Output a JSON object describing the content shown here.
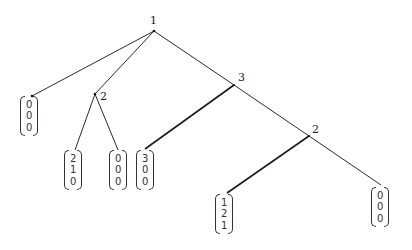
{
  "diagram": {
    "type": "tree",
    "nodes": [
      {
        "id": "root",
        "label": "1",
        "x": 154,
        "y": 31
      },
      {
        "id": "n2",
        "label": "2",
        "x": 95,
        "y": 94
      },
      {
        "id": "n3",
        "label": "3",
        "x": 234,
        "y": 85
      },
      {
        "id": "n2b",
        "label": "2",
        "x": 309,
        "y": 136
      }
    ],
    "leaves": [
      {
        "id": "leaf-a",
        "vector": [
          "0",
          "0",
          "0"
        ],
        "parent": "root"
      },
      {
        "id": "leaf-b",
        "vector": [
          "2",
          "1",
          "0"
        ],
        "parent": "n2"
      },
      {
        "id": "leaf-c",
        "vector": [
          "0",
          "0",
          "0"
        ],
        "parent": "n2"
      },
      {
        "id": "leaf-d",
        "vector": [
          "3",
          "0",
          "0"
        ],
        "parent": "n3"
      },
      {
        "id": "leaf-e",
        "vector": [
          "1",
          "2",
          "1"
        ],
        "parent": "n2b"
      },
      {
        "id": "leaf-f",
        "vector": [
          "0",
          "0",
          "0"
        ],
        "parent": "n2b"
      }
    ],
    "labels": {
      "root": "1",
      "n2": "2",
      "n3": "3",
      "n2b": "2"
    }
  }
}
